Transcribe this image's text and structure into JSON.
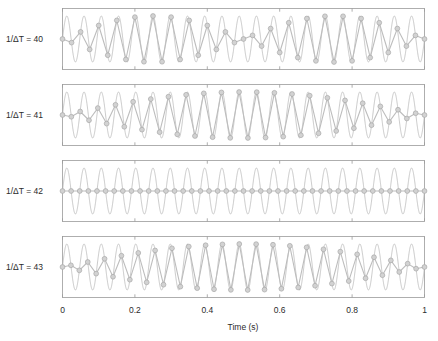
{
  "figure": {
    "type": "multi-panel-line",
    "background": "#ffffff",
    "signal_color": "#b5b5b5",
    "sampled_color": "#bdbdbd",
    "marker_fill": "#d2d2d2",
    "marker_stroke": "#a8a8a8",
    "frame_color": "#9b9b9b"
  },
  "axis": {
    "xlabel": "Time (s)",
    "xticks": [
      0,
      0.2,
      0.4,
      0.6,
      0.8,
      1
    ],
    "xtick_labels": [
      "0",
      "0.2",
      "0.4",
      "0.6",
      "0.8",
      "1"
    ],
    "xlim": [
      0,
      1
    ],
    "ylim": [
      -1.35,
      1.35
    ],
    "grid": false
  },
  "panels": [
    {
      "label": "1/ΔT = 40",
      "rate": 40,
      "label_prefix": "1/",
      "label_delta": "Δ",
      "label_var": "T",
      "label_eq": " = ",
      "label_value": "40"
    },
    {
      "label": "1/ΔT = 41",
      "rate": 41,
      "label_prefix": "1/",
      "label_delta": "Δ",
      "label_var": "T",
      "label_eq": " = ",
      "label_value": "41"
    },
    {
      "label": "1/ΔT = 42",
      "rate": 42,
      "label_prefix": "1/",
      "label_delta": "Δ",
      "label_var": "T",
      "label_eq": " = ",
      "label_value": "42"
    },
    {
      "label": "1/ΔT = 43",
      "rate": 43,
      "label_prefix": "1/",
      "label_delta": "Δ",
      "label_var": "T",
      "label_eq": " = ",
      "label_value": "43"
    }
  ],
  "chart_data": {
    "type": "line",
    "title": "",
    "xlabel": "Time (s)",
    "ylabel": "",
    "xlim": [
      0,
      1
    ],
    "ylim": [
      -1.35,
      1.35
    ],
    "xticks": [
      0,
      0.2,
      0.4,
      0.6,
      0.8,
      1
    ],
    "grid": false,
    "legend": "none",
    "signal": {
      "description": "continuous sinusoid",
      "frequency_hz": 21,
      "amplitude": 1,
      "phase_rad": 0,
      "equation": "y(t) = sin(2*pi*21*t)"
    },
    "panels": [
      {
        "name": "1/ΔT = 40",
        "sample_rate_hz": 40,
        "n_samples": 41,
        "alias_frequency_hz": 1,
        "series": [
          {
            "name": "continuous 21 Hz sinusoid",
            "color": "#b5b5b5",
            "style": "solid"
          },
          {
            "name": "samples joined by straight lines",
            "color": "#bdbdbd",
            "style": "solid-with-circle-markers"
          }
        ]
      },
      {
        "name": "1/ΔT = 41",
        "sample_rate_hz": 41,
        "n_samples": 42,
        "alias_frequency_hz": 1,
        "series": [
          {
            "name": "continuous 21 Hz sinusoid",
            "color": "#b5b5b5",
            "style": "solid"
          },
          {
            "name": "samples joined by straight lines",
            "color": "#bdbdbd",
            "style": "solid-with-circle-markers"
          }
        ]
      },
      {
        "name": "1/ΔT = 42",
        "sample_rate_hz": 42,
        "n_samples": 43,
        "alias_frequency_hz": 0,
        "series": [
          {
            "name": "continuous 21 Hz sinusoid",
            "color": "#b5b5b5",
            "style": "solid"
          },
          {
            "name": "samples joined by straight lines",
            "color": "#bdbdbd",
            "style": "solid-with-circle-markers"
          }
        ]
      },
      {
        "name": "1/ΔT = 43",
        "sample_rate_hz": 43,
        "n_samples": 44,
        "alias_frequency_hz": 1,
        "series": [
          {
            "name": "continuous 21 Hz sinusoid",
            "color": "#b5b5b5",
            "style": "solid"
          },
          {
            "name": "samples joined by straight lines",
            "color": "#bdbdbd",
            "style": "solid-with-circle-markers"
          }
        ]
      }
    ]
  }
}
